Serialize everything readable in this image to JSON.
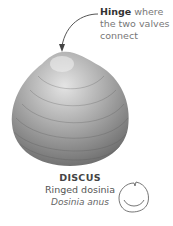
{
  "annotation": {
    "bold": "Hinge",
    "rest": " where the two valves connect"
  },
  "caption": {
    "genus": "DISCUS",
    "common_name": "Ringed dosinia",
    "scientific_name": "Dosinia anus"
  },
  "colors": {
    "shell_light": "#d8d8d8",
    "shell_dark": "#6e6e6e",
    "text": "#555555"
  }
}
